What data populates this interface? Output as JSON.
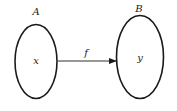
{
  "diagram": {
    "sets": [
      {
        "label": "A",
        "element": "x"
      },
      {
        "label": "B",
        "element": "y"
      }
    ],
    "mapping": {
      "label": "f",
      "from": "x",
      "to": "y"
    },
    "colors": {
      "stroke": "#1a1a1a",
      "background": "#ffffff"
    }
  }
}
